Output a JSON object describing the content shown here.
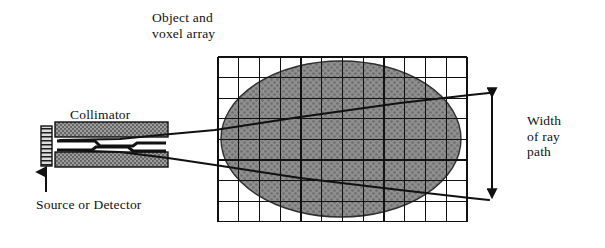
{
  "figure": {
    "kind": "technical-diagram",
    "background_color": "#ffffff",
    "ink_color": "#111111"
  },
  "labels": {
    "object_voxel_array": "Object and\nvoxel array",
    "collimator": "Collimator",
    "source_or_detector": "Source or Detector",
    "width_of_ray_path": "Width\nof ray\npath"
  },
  "voxel_grid": {
    "columns": 12,
    "rows": 8,
    "x": 218,
    "y": 57,
    "cell_width": 20.75,
    "cell_height": 20.6,
    "line_color": "#111111",
    "line_width": 1.1,
    "fill_color": "#ffffff"
  },
  "object_ellipse": {
    "center_x": 341,
    "center_y": 139,
    "radius_x": 120,
    "radius_y": 78,
    "fill_color": "#8f8f8f",
    "stipple_color": "#6b6b6b",
    "stroke_color": "#2b2b2b"
  },
  "collimator": {
    "upper_bar": {
      "x": 55,
      "y": 122,
      "width": 113,
      "height": 15
    },
    "lower_bar": {
      "x": 55,
      "y": 152,
      "width": 113,
      "height": 15
    },
    "fill_color": "#9a9a9a",
    "stipple_color": "#555555",
    "stroke_color": "#111111"
  },
  "source_block": {
    "x": 41,
    "y": 126,
    "width": 11,
    "height": 40,
    "fill_color": "#d8d8d8",
    "stroke_color": "#111111",
    "hatch_color": "#222222"
  },
  "source_pointer_arrow": {
    "from_x": 46,
    "from_y": 192,
    "to_x": 46,
    "to_y": 170,
    "color": "#111111"
  },
  "rays": {
    "color": "#111111",
    "line_width": 2.2,
    "upper_ray_points": "60,140 120,139 160,135 215,130 300,117 400,103 470,95 489,93",
    "lower_ray_points": "60,150 120,152 168,158 215,165 300,178 400,190 470,198 489,200",
    "description": "Two bounding rays of the collimated beam diverging through the voxelized object"
  },
  "width_dimension_arrow": {
    "x": 492,
    "top_y": 92,
    "bottom_y": 201,
    "tick_left_x": 466,
    "color": "#111111",
    "style": "double-headed"
  }
}
